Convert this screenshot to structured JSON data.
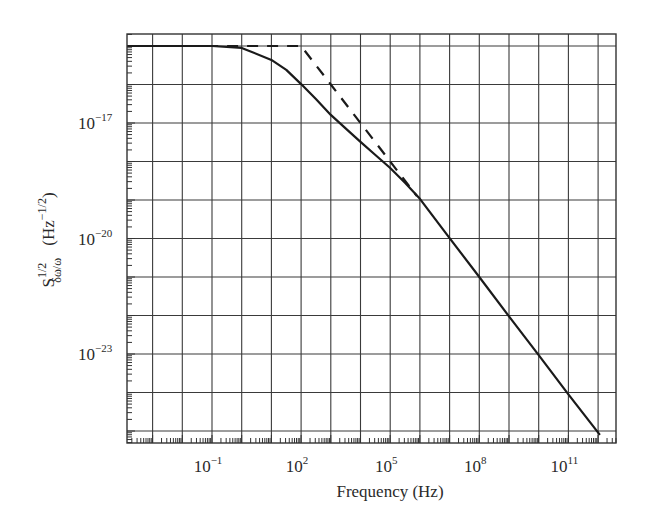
{
  "chart_data": {
    "type": "line",
    "title": "",
    "xlabel": "Frequency (Hz)",
    "ylabel": "S^{1/2}_{δω/ω} (Hz^{-1/2})",
    "ylabel_parts": {
      "base": "S",
      "sup": "1/2",
      "sub": "δω/ω",
      "unit_base": "(Hz",
      "unit_sup": "−1/2",
      "unit_close": ")"
    },
    "xscale": "log",
    "yscale": "log",
    "xlim_log10": [
      -3.86,
      12.75
    ],
    "ylim_log10": [
      -25.3,
      -14.7
    ],
    "grid": true,
    "x_gridlines_log10": [
      -3,
      -2,
      -1,
      0,
      1,
      2,
      3,
      4,
      5,
      6,
      7,
      8,
      9,
      10,
      11,
      12
    ],
    "y_gridlines_log10": [
      -15,
      -16,
      -17,
      -18,
      -19,
      -20,
      -21,
      -22,
      -23,
      -24,
      -25
    ],
    "x_ticks": [
      {
        "log10": -1,
        "base": "10",
        "exp": "−1"
      },
      {
        "log10": 2,
        "base": "10",
        "exp": "2"
      },
      {
        "log10": 5,
        "base": "10",
        "exp": "5"
      },
      {
        "log10": 8,
        "base": "10",
        "exp": "8"
      },
      {
        "log10": 11,
        "base": "10",
        "exp": "11"
      }
    ],
    "y_ticks": [
      {
        "log10": -17,
        "base": "10",
        "exp": "−17"
      },
      {
        "log10": -20,
        "base": "10",
        "exp": "−20"
      },
      {
        "log10": -23,
        "base": "10",
        "exp": "−23"
      }
    ],
    "legend": null,
    "series": [
      {
        "name": "solid",
        "style": "solid",
        "color": "#1a1a1a",
        "points_log10": [
          [
            -3.86,
            -15.0
          ],
          [
            -1,
            -15.0
          ],
          [
            0,
            -15.05
          ],
          [
            1,
            -15.36
          ],
          [
            1.5,
            -15.62
          ],
          [
            2,
            -15.99
          ],
          [
            2.5,
            -16.38
          ],
          [
            3,
            -16.79
          ],
          [
            3.5,
            -17.14
          ],
          [
            4,
            -17.49
          ],
          [
            4.5,
            -17.83
          ],
          [
            5,
            -18.17
          ],
          [
            5.5,
            -18.55
          ],
          [
            6,
            -18.97
          ],
          [
            7,
            -19.99
          ],
          [
            8,
            -21.0
          ],
          [
            9,
            -22.02
          ],
          [
            10,
            -23.03
          ],
          [
            11,
            -24.05
          ],
          [
            12.06,
            -25.1
          ]
        ]
      },
      {
        "name": "dashed",
        "style": "dashed",
        "color": "#1a1a1a",
        "points_log10": [
          [
            -3.86,
            -15.0
          ],
          [
            2,
            -15.0
          ],
          [
            3,
            -16.0
          ],
          [
            4,
            -17.0
          ],
          [
            5,
            -18.0
          ],
          [
            5.9,
            -18.9
          ]
        ]
      }
    ]
  },
  "layout": {
    "plot_left": 127,
    "plot_right": 616,
    "plot_top": 34,
    "plot_bottom": 443,
    "x_ref_log10": -1,
    "x_ref_px": 212,
    "x_px_per_decade": 29.7,
    "y_ref_log10": -17,
    "y_ref_px": 123,
    "y_px_per_decade": 38.5
  }
}
